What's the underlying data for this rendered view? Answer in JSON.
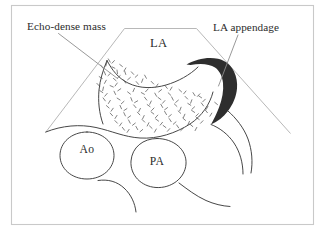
{
  "figure": {
    "kind": "echocardiogram-schematic",
    "background_color": "#ffffff",
    "frame_color": "#c9c9c9",
    "ink_color": "#3d3d3d",
    "sector_color": "#b8b8b8",
    "leader_color": "#8d8d8d",
    "speckle_color": "#6b6b6b"
  },
  "callouts": {
    "left": {
      "label": "Echo-dense mass",
      "x": 27,
      "y": 30
    },
    "right": {
      "label": "LA appendage",
      "x": 213,
      "y": 31
    }
  },
  "regions": {
    "chamber": {
      "label": "LA",
      "x": 150,
      "y": 47
    }
  },
  "vessels": [
    {
      "label": "Ao",
      "x": 87,
      "y": 153
    },
    {
      "label": "PA",
      "x": 153,
      "y": 163
    }
  ],
  "structures": {
    "sector": "ultrasound-sector-trapezoid",
    "mass": "echo-dense-mass-speckle-field",
    "appendage": "left-atrial-appendage-crescent",
    "aorta": "aorta-circle",
    "pulmonary_artery": "pulmonary-artery-oval"
  }
}
